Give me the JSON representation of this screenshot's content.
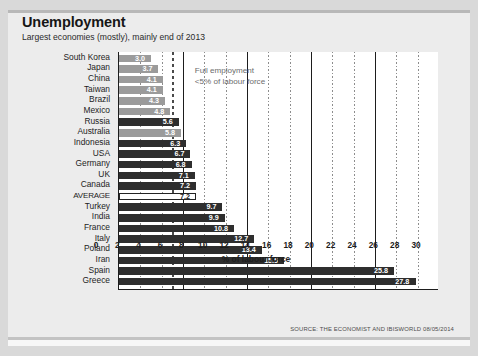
{
  "header": {
    "title": "Unemployment",
    "subtitle": "Largest economies (mostly), mainly end of 2013"
  },
  "annotation": {
    "line1": "Full employment",
    "line2": "<5% of labour force"
  },
  "source": "SOURCE: THE ECONOMIST AND IBISWORLD 08/05/2014",
  "colors": {
    "bar_light": "#9b9b9b",
    "bar_dark": "#2e2e2e",
    "average_fill": "#ffffff",
    "average_border": "#242424",
    "plot_background": "#ffffff",
    "card_background": "#ececec",
    "page_background": "#d9d9d9",
    "axis": "#1d1d1d"
  },
  "chart_data": {
    "type": "bar",
    "orientation": "horizontal",
    "title": "Unemployment",
    "subtitle": "Largest economies (mostly), mainly end of 2013",
    "xlabel": "% of labour force",
    "ylabel": "",
    "xlim": [
      0,
      30
    ],
    "xticks": [
      0,
      2,
      4,
      6,
      8,
      10,
      12,
      14,
      16,
      18,
      20,
      22,
      24,
      26,
      28,
      30
    ],
    "grid": true,
    "legend": false,
    "threshold_line": 5,
    "categories": [
      "South Korea",
      "Japan",
      "China",
      "Taiwan",
      "Brazil",
      "Mexico",
      "Russia",
      "Australia",
      "Indonesia",
      "USA",
      "Germany",
      "UK",
      "Canada",
      "AVERAGE",
      "Turkey",
      "India",
      "France",
      "Italy",
      "Poland",
      "Iran",
      "Spain",
      "Greece"
    ],
    "values": [
      3.0,
      3.7,
      4.1,
      4.1,
      4.3,
      4.8,
      5.6,
      5.8,
      6.3,
      6.7,
      6.8,
      7.1,
      7.2,
      7.2,
      9.7,
      9.9,
      10.8,
      12.7,
      13.4,
      15.5,
      25.8,
      27.8
    ],
    "value_labels": [
      "3.0",
      "3.7",
      "4.1",
      "4.1",
      "4.3",
      "4.8",
      "5.6",
      "5.8",
      "6.3",
      "6.7",
      "6.8",
      "7.1",
      "7.2",
      "7.2",
      "9.7",
      "9.9",
      "10.8",
      "12.7",
      "13.4",
      "15.5",
      "25.8",
      "27.8"
    ],
    "styles": [
      "light",
      "light",
      "light",
      "light",
      "light",
      "light",
      "dark",
      "light",
      "dark",
      "dark",
      "dark",
      "dark",
      "dark",
      "avg",
      "dark",
      "dark",
      "dark",
      "dark",
      "dark",
      "dark",
      "dark",
      "dark"
    ]
  }
}
